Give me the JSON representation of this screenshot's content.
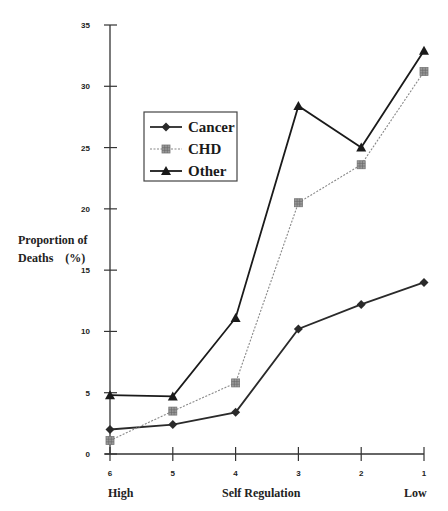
{
  "chart_data": {
    "type": "line",
    "title": "",
    "xlabel": "Self Regulation",
    "xlabel_left": "High",
    "xlabel_right": "Low",
    "ylabel": "Proportion of Deaths (%)",
    "ylabel_line1": "Proportion of",
    "ylabel_line2": "Deaths    (%)",
    "x": [
      "6",
      "5",
      "4",
      "3",
      "2",
      "1"
    ],
    "ylim": [
      0,
      35
    ],
    "yticks": [
      0,
      5,
      10,
      15,
      20,
      25,
      30,
      35
    ],
    "grid": false,
    "legend_position": "upper-left-inside",
    "series": [
      {
        "name": "Cancer",
        "marker": "diamond",
        "line": "solid",
        "color": "#2a2a2a",
        "values": [
          2.0,
          2.4,
          3.4,
          10.2,
          12.2,
          14.0
        ]
      },
      {
        "name": "CHD",
        "marker": "square",
        "line": "dotted",
        "color": "#888888",
        "values": [
          1.1,
          3.5,
          5.8,
          20.5,
          23.6,
          31.2
        ]
      },
      {
        "name": "Other",
        "marker": "triangle",
        "line": "solid",
        "color": "#1a1a1a",
        "values": [
          4.8,
          4.7,
          11.1,
          28.4,
          25.0,
          32.9
        ]
      }
    ]
  }
}
